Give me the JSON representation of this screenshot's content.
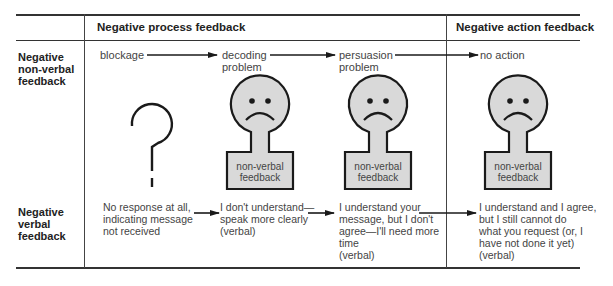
{
  "columns": {
    "process_header": "Negative process feedback",
    "action_header": "Negative action feedback"
  },
  "rows": {
    "nonverbal_label": [
      "Negative",
      "non-verbal",
      "feedback"
    ],
    "verbal_label": [
      "Negative",
      "verbal",
      "feedback"
    ]
  },
  "stages": [
    {
      "id": "blockage",
      "lines": [
        "blockage"
      ]
    },
    {
      "id": "decoding",
      "lines": [
        "decoding",
        "problem"
      ]
    },
    {
      "id": "persuasion",
      "lines": [
        "persuasion",
        "problem"
      ]
    },
    {
      "id": "no-action",
      "lines": [
        "no action"
      ]
    }
  ],
  "faces": [
    {
      "id": "blockage",
      "icon": "question-mark-icon",
      "label": ""
    },
    {
      "id": "decoding",
      "icon": "sad-face-icon",
      "label_lines": [
        "non-verbal",
        "feedback"
      ]
    },
    {
      "id": "persuasion",
      "icon": "sad-face-icon",
      "label_lines": [
        "non-verbal",
        "feedback"
      ]
    },
    {
      "id": "no-action",
      "icon": "sad-face-icon",
      "label_lines": [
        "non-verbal",
        "feedback"
      ]
    }
  ],
  "verbal": [
    {
      "id": "blockage",
      "lines": [
        "No response at all,",
        "indicating message",
        "not received"
      ]
    },
    {
      "id": "decoding",
      "lines": [
        "I don't understand—",
        "speak more clearly",
        "(verbal)"
      ]
    },
    {
      "id": "persuasion",
      "lines": [
        "I understand your",
        "message, but I don't",
        "agree—I'll need more",
        "time",
        "(verbal)"
      ]
    },
    {
      "id": "no-action",
      "lines": [
        "I understand and I agree,",
        "but I still cannot do",
        "what you request (or, I",
        "have not done it yet)",
        "(verbal)"
      ]
    }
  ],
  "colors": {
    "face_fill": "#d9d9d9",
    "stroke": "#1a1a1a",
    "text": "#444444"
  }
}
